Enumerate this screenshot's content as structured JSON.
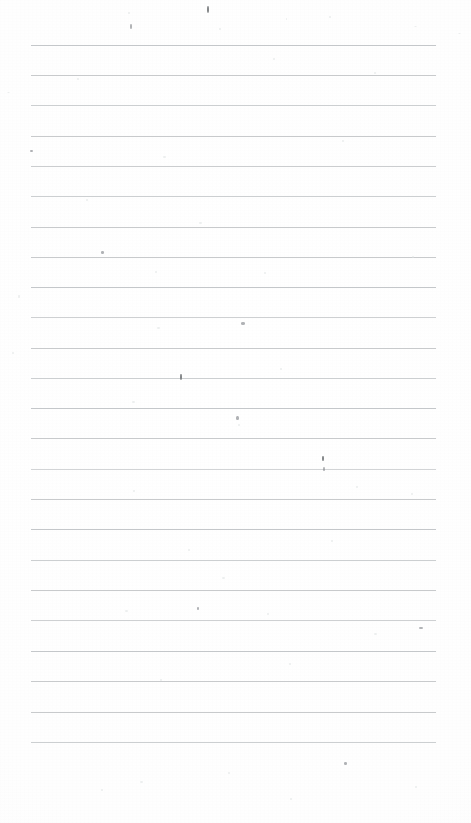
{
  "document": {
    "type": "scanned-ruled-notebook-page",
    "title": "Blank Ruled Notebook Page",
    "description": "Scanned blank lined writing paper with no handwriting or printed text",
    "width_px": 471,
    "height_px": 823,
    "paper_color": "#fefefe",
    "has_visible_text": false,
    "handwriting_present": false
  },
  "ruling": {
    "line_color": "#c3c6c8",
    "line_thickness_px": 1,
    "line_start_x_px": 31,
    "line_end_x_px": 436,
    "line_length_px": 405,
    "first_line_y_px": 45,
    "last_line_y_px": 742,
    "line_spacing_px": 30.3,
    "line_count": 24,
    "margin_rule_present": false,
    "line_y_positions": [
      45,
      75,
      105,
      136,
      166,
      196,
      227,
      257,
      287,
      317,
      348,
      378,
      408,
      438,
      469,
      499,
      529,
      560,
      590,
      620,
      651,
      681,
      712,
      742
    ]
  },
  "margins": {
    "top_margin_px": 45,
    "bottom_margin_px": 81,
    "left_margin_px": 31,
    "right_margin_px": 35
  },
  "artifacts": {
    "label": "scan-dust-and-speckles",
    "count": 46,
    "specks": [
      {
        "x": 207,
        "y": 6,
        "w": 2,
        "h": 7,
        "tone": "darker"
      },
      {
        "x": 128,
        "y": 12,
        "w": 2,
        "h": 2,
        "tone": "faint"
      },
      {
        "x": 219,
        "y": 28,
        "w": 2,
        "h": 2,
        "tone": "faint"
      },
      {
        "x": 286,
        "y": 18,
        "w": 1,
        "h": 2,
        "tone": "faint"
      },
      {
        "x": 130,
        "y": 24,
        "w": 2,
        "h": 5,
        "tone": "dark"
      },
      {
        "x": 329,
        "y": 16,
        "w": 2,
        "h": 2,
        "tone": "faint"
      },
      {
        "x": 414,
        "y": 26,
        "w": 3,
        "h": 1,
        "tone": "faint"
      },
      {
        "x": 458,
        "y": 33,
        "w": 3,
        "h": 1,
        "tone": "faint"
      },
      {
        "x": 7,
        "y": 92,
        "w": 3,
        "h": 1,
        "tone": "faint"
      },
      {
        "x": 77,
        "y": 78,
        "w": 2,
        "h": 2,
        "tone": "faint"
      },
      {
        "x": 273,
        "y": 58,
        "w": 2,
        "h": 2,
        "tone": "faint"
      },
      {
        "x": 374,
        "y": 72,
        "w": 2,
        "h": 2,
        "tone": "faint"
      },
      {
        "x": 30,
        "y": 150,
        "w": 3,
        "h": 2,
        "tone": "dark"
      },
      {
        "x": 163,
        "y": 156,
        "w": 3,
        "h": 2,
        "tone": "faint"
      },
      {
        "x": 342,
        "y": 140,
        "w": 2,
        "h": 2,
        "tone": "faint"
      },
      {
        "x": 86,
        "y": 199,
        "w": 2,
        "h": 2,
        "tone": "faint"
      },
      {
        "x": 199,
        "y": 222,
        "w": 3,
        "h": 2,
        "tone": "faint"
      },
      {
        "x": 101,
        "y": 251,
        "w": 3,
        "h": 3,
        "tone": "dark"
      },
      {
        "x": 155,
        "y": 271,
        "w": 2,
        "h": 2,
        "tone": "faint"
      },
      {
        "x": 264,
        "y": 272,
        "w": 2,
        "h": 2,
        "tone": "faint"
      },
      {
        "x": 412,
        "y": 256,
        "w": 2,
        "h": 2,
        "tone": "faint"
      },
      {
        "x": 18,
        "y": 295,
        "w": 2,
        "h": 3,
        "tone": "faint"
      },
      {
        "x": 157,
        "y": 327,
        "w": 3,
        "h": 2,
        "tone": "faint"
      },
      {
        "x": 241,
        "y": 322,
        "w": 4,
        "h": 3,
        "tone": "dark"
      },
      {
        "x": 12,
        "y": 352,
        "w": 2,
        "h": 2,
        "tone": "faint"
      },
      {
        "x": 180,
        "y": 374,
        "w": 2,
        "h": 6,
        "tone": "darker"
      },
      {
        "x": 280,
        "y": 368,
        "w": 2,
        "h": 2,
        "tone": "faint"
      },
      {
        "x": 132,
        "y": 401,
        "w": 3,
        "h": 2,
        "tone": "faint"
      },
      {
        "x": 236,
        "y": 416,
        "w": 3,
        "h": 4,
        "tone": "dark"
      },
      {
        "x": 238,
        "y": 424,
        "w": 2,
        "h": 2,
        "tone": "faint"
      },
      {
        "x": 322,
        "y": 456,
        "w": 2,
        "h": 5,
        "tone": "darker"
      },
      {
        "x": 323,
        "y": 467,
        "w": 2,
        "h": 4,
        "tone": "dark"
      },
      {
        "x": 356,
        "y": 486,
        "w": 2,
        "h": 2,
        "tone": "faint"
      },
      {
        "x": 133,
        "y": 490,
        "w": 2,
        "h": 2,
        "tone": "faint"
      },
      {
        "x": 411,
        "y": 493,
        "w": 2,
        "h": 2,
        "tone": "faint"
      },
      {
        "x": 331,
        "y": 540,
        "w": 2,
        "h": 2,
        "tone": "faint"
      },
      {
        "x": 188,
        "y": 549,
        "w": 2,
        "h": 2,
        "tone": "faint"
      },
      {
        "x": 222,
        "y": 577,
        "w": 3,
        "h": 2,
        "tone": "faint"
      },
      {
        "x": 125,
        "y": 610,
        "w": 3,
        "h": 2,
        "tone": "faint"
      },
      {
        "x": 197,
        "y": 607,
        "w": 2,
        "h": 3,
        "tone": "dark"
      },
      {
        "x": 267,
        "y": 613,
        "w": 2,
        "h": 2,
        "tone": "faint"
      },
      {
        "x": 374,
        "y": 633,
        "w": 3,
        "h": 2,
        "tone": "faint"
      },
      {
        "x": 419,
        "y": 627,
        "w": 4,
        "h": 2,
        "tone": "dark"
      },
      {
        "x": 289,
        "y": 663,
        "w": 2,
        "h": 2,
        "tone": "faint"
      },
      {
        "x": 160,
        "y": 679,
        "w": 2,
        "h": 2,
        "tone": "faint"
      },
      {
        "x": 344,
        "y": 762,
        "w": 3,
        "h": 3,
        "tone": "dark"
      },
      {
        "x": 101,
        "y": 789,
        "w": 2,
        "h": 2,
        "tone": "faint"
      },
      {
        "x": 140,
        "y": 781,
        "w": 3,
        "h": 2,
        "tone": "faint"
      },
      {
        "x": 228,
        "y": 772,
        "w": 2,
        "h": 2,
        "tone": "faint"
      },
      {
        "x": 290,
        "y": 798,
        "w": 2,
        "h": 2,
        "tone": "faint"
      },
      {
        "x": 415,
        "y": 786,
        "w": 2,
        "h": 2,
        "tone": "faint"
      }
    ]
  }
}
